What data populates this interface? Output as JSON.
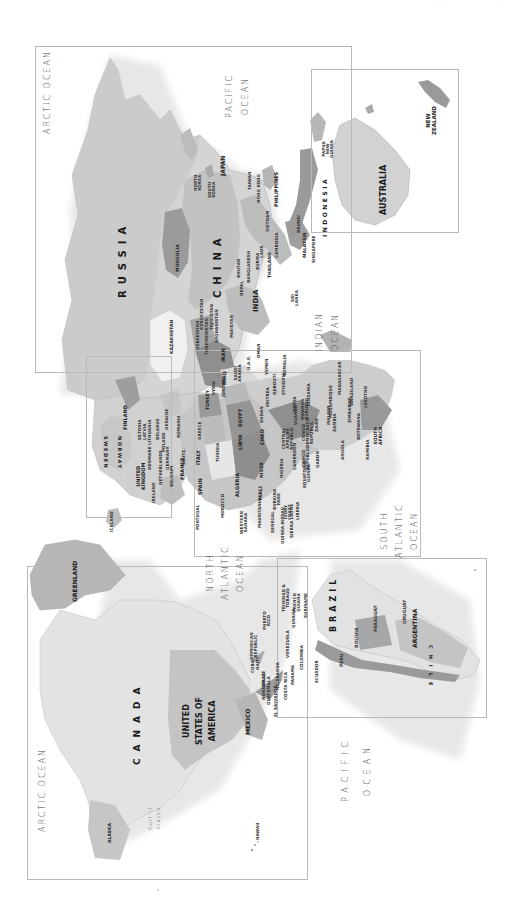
{
  "page": {
    "corner_text": [
      "· · · · ·",
      "· · ·"
    ],
    "orientation": "rotated 90° clockwise (north toward left)"
  },
  "colors": {
    "background": "#ffffff",
    "land_light": "#e6e6e6",
    "land_mid": "#cfcfcf",
    "land_dark": "#a8a8a8",
    "land_darker": "#8e8e8e",
    "frame": "#b9b9b9",
    "text": "#222222"
  },
  "oceans": {
    "arctic_top": "ARCTIC OCEAN",
    "pacific_top": "PACIFIC\nOCEAN",
    "indian": "INDIAN\nOCEAN",
    "south_atlantic": "SOUTH\nATLANTIC\nOCEAN",
    "north_atlantic": "NORTH\nATLANTIC\nOCEAN",
    "pacific_bottom": "PACIFIC\nOCEAN",
    "arctic_bottom": "ARCTIC OCEAN",
    "gulf_of_alaska": "Gulf of\nAlaska"
  },
  "regions": {
    "asia": {
      "russia": "RUSSIA",
      "china": "CHINA",
      "mongolia": "MONGOLIA",
      "kazakhstan": "KAZAKHSTAN",
      "japan": "JAPAN",
      "north_korea": "NORTH\nKOREA",
      "south_korea": "SOUTH\nKOREA",
      "taiwan": "TAIWAN",
      "hong_kong": "HONG KONG",
      "philippines": "PHILIPPINES",
      "vietnam": "VIETNAM",
      "laos": "LAOS",
      "thailand": "THAILAND",
      "cambodia": "CAMBODIA",
      "malaysia": "MALAYSIA",
      "brunei": "BRUNEI",
      "singapore": "SINGAPORE",
      "indonesia": "INDONESIA",
      "india": "INDIA",
      "nepal": "NEPAL",
      "bhutan": "BHUTAN",
      "bangladesh": "BANGLADESH",
      "burma": "BURMA",
      "sri_lanka": "SRI\nLANKA",
      "pakistan": "PAKISTAN",
      "afghanistan": "AFGHANISTAN",
      "uzbekistan": "UZBEKISTAN",
      "kyrgyzstan": "KYRGYZSTAN",
      "turkmenistan": "TURKMENISTAN",
      "tajikistan": "TAJIKISTAN",
      "iran": "IRAN",
      "iraq": "IRAQ",
      "syria": "SYRIA",
      "jordan": "JORDAN",
      "saudi_arabia": "SAUDI\nARABIA",
      "yemen": "YEMEN",
      "oman": "OMAN",
      "uae": "U.A.E.",
      "turkey": "TURKEY"
    },
    "oceania": {
      "australia": "AUSTRALIA",
      "new_zealand": "NEW\nZEALAND",
      "papua_new_guinea": "PAPUA\nNEW\nGUINEA"
    },
    "europe": {
      "norway": "NORWAY",
      "sweden": "SWEDEN",
      "finland": "FINLAND",
      "united_kingdom": "UNITED\nKINGDOM",
      "ireland": "IRELAND",
      "iceland": "ICELAND",
      "france": "FRANCE",
      "spain": "SPAIN",
      "portugal": "PORTUGAL",
      "italy": "ITALY",
      "greece": "GREECE",
      "germany": "GERMANY",
      "poland": "POLAND",
      "ukraine": "UKRAINE",
      "belarus": "BELARUS",
      "netherlands": "NETHERLANDS",
      "belgium": "BELGIUM",
      "denmark": "DENMARK",
      "switzerland": "SWITZ.",
      "estonia": "ESTONIA",
      "latvia": "LATVIA",
      "lithuania": "LITHUANIA",
      "romania": "ROMANIA"
    },
    "africa": {
      "egypt": "EGYPT",
      "libya": "LIBYA",
      "algeria": "ALGERIA",
      "morocco": "MOROCCO",
      "tunisia": "TUNISIA",
      "western_sahara": "WESTERN\nSAHARA",
      "mauritania": "MAURITANIA",
      "mali": "MALI",
      "niger": "NIGER",
      "chad": "CHAD",
      "sudan": "SUDAN",
      "eritrea": "ERITREA",
      "djibouti": "DJIBOUTI",
      "ethiopia": "ETHIOPIA",
      "somalia": "SOMALIA",
      "senegal": "SENEGAL",
      "guinea_bissau": "GUINEA-BISSAU",
      "sierra_leone": "SIERRA LEONE",
      "liberia": "LIBERIA",
      "ivory_coast": "IVORY\nCOAST",
      "burkina_faso": "BURKINA\nFASO",
      "nigeria": "NIGERIA",
      "cameroon": "CAMEROON",
      "central_african_republic": "CENTRAL\nAFRICAN\nREPUBLIC",
      "equatorial_guinea": "EQUATORIAL\nGUINEA",
      "gabon": "GABON",
      "congo_republic": "CONGO\nREPUBLIC",
      "dr_congo": "CONGO\nDEMOCRATIC\nREPUBLIC",
      "uganda": "UGANDA",
      "kenya": "KENYA",
      "rwanda": "RWANDA",
      "burundi": "BURUNDI",
      "tanzania": "TANZANIA",
      "zaire": "ZAIRE",
      "angola": "ANGOLA",
      "zambia": "ZAMBIA",
      "malawi": "MALAWI",
      "mozambique": "MOZAMBIQUE",
      "zimbabwe": "ZIMBABWE",
      "namibia": "NAMIBIA",
      "botswana": "BOTSWANA",
      "south_africa": "SOUTH\nAFRICA",
      "swaziland": "SWAZILAND",
      "lesotho": "LESOTHO",
      "madagascar": "MADAGASCAR"
    },
    "north_america": {
      "canada": "CANADA",
      "usa": "UNITED\nSTATES OF\nAMERICA",
      "mexico": "MEXICO",
      "alaska": "ALASKA",
      "greenland": "GREENLAND",
      "hawaii": "HAWAII",
      "cuba": "CUBA",
      "dominican_republic": "DOMINICAN\nREPUBLIC",
      "haiti": "HAITI",
      "puerto_rico": "PUERTO\nRICO",
      "belize": "BELIZE",
      "guatemala": "GUATEMALA",
      "honduras": "HONDURAS",
      "el_salvador": "EL SALVADOR",
      "nicaragua": "NICARAGUA",
      "costa_rica": "COSTA RICA",
      "panama": "PANAMA",
      "trinidad_tobago": "TRINIDAD &\nTOBAGO"
    },
    "south_america": {
      "brazil": "BRAZIL",
      "argentina": "ARGENTINA",
      "chile": "CHILE",
      "peru": "PERU",
      "bolivia": "BOLIVIA",
      "paraguay": "PARAGUAY",
      "uruguay": "URUGUAY",
      "ecuador": "ECUADOR",
      "colombia": "COLOMBIA",
      "venezuela": "VENEZUELA",
      "guyana": "GUYANA",
      "suriname": "SURINAME",
      "french_guiana": "FRENCH\nGUIANA"
    }
  }
}
